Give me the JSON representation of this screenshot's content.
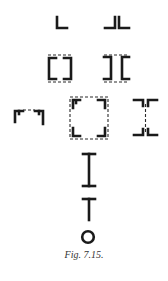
{
  "figure": {
    "caption": "Fig. 7.15.",
    "ink_color": "#1a1a1a",
    "background": "#ffffff",
    "shapes": [
      {
        "id": "angle-single",
        "description": "single angle section (L)"
      },
      {
        "id": "angle-double-back-to-back",
        "description": "two angles back to back (JL)"
      },
      {
        "id": "four-angles-box-bracket",
        "description": "four angles forming a box with dashed lacing"
      },
      {
        "id": "four-angles-i-section",
        "description": "four angles forming I-section with dashed lacing"
      },
      {
        "id": "channel-open-top",
        "description": "two angles forming an open channel with dashed lacing"
      },
      {
        "id": "four-angles-square-box",
        "description": "four angles at corners of a dashed square box"
      },
      {
        "id": "four-angles-i-with-web-dashed",
        "description": "four angles forming I with dashed web"
      },
      {
        "id": "i-beam",
        "description": "rolled I-beam section"
      },
      {
        "id": "tee-section",
        "description": "T section"
      },
      {
        "id": "circular-section",
        "description": "circular / tube section"
      }
    ]
  }
}
